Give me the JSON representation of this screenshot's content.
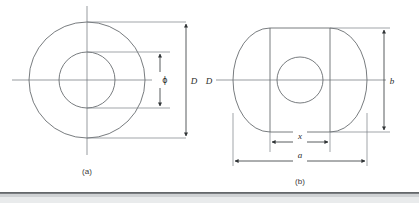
{
  "figure": {
    "panels": [
      {
        "id": "a",
        "caption": "(a)",
        "shape": "concentric-circles",
        "dimensions": [
          {
            "name": "phi-dimension",
            "label": "ϕ",
            "measures": "inner circle diameter",
            "orientation": "vertical"
          },
          {
            "name": "d-dimension",
            "label": "D",
            "measures": "outer circle diameter",
            "orientation": "vertical"
          }
        ]
      },
      {
        "id": "b",
        "caption": "(b)",
        "shape": "obround-with-centre-circle",
        "dimensions": [
          {
            "name": "d-dimension",
            "label": "D",
            "measures": "overall height at centreline",
            "orientation": "vertical"
          },
          {
            "name": "b-dimension",
            "label": "b",
            "measures": "straight-section height",
            "orientation": "vertical"
          },
          {
            "name": "x-dimension",
            "label": "x",
            "measures": "straight-section width",
            "orientation": "horizontal"
          },
          {
            "name": "a-dimension",
            "label": "a",
            "measures": "overall width",
            "orientation": "horizontal"
          }
        ]
      }
    ]
  },
  "labels": {
    "phi": "ϕ",
    "d_left": "D",
    "d_panel_b": "D",
    "b": "b",
    "x": "x",
    "a": "a",
    "caption_a": "(a)",
    "caption_b": "(b)"
  },
  "colors": {
    "outline": "#555a5e",
    "centerline": "#6b7075",
    "extension": "#7a7f84",
    "dimension": "#2f3335",
    "text": "#2b2b2b",
    "caption": "#3a3a3a",
    "rule_dark": "#3f4448",
    "rule_soft": "#cfd2d4",
    "background": "#ffffff"
  }
}
